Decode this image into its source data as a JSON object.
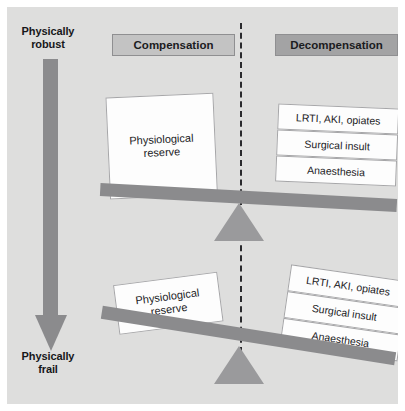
{
  "diagram": {
    "axis": {
      "top_label": "Physically\nrobust",
      "top_label_line1": "Physically",
      "top_label_line2": "robust",
      "bottom_label_line1": "Physically",
      "bottom_label_line2": "frail",
      "arrow_color": "#8b8b8d",
      "direction": "down"
    },
    "headers": [
      {
        "id": "compensation",
        "label": "Compensation",
        "fill": "#c3c3c3"
      },
      {
        "id": "decompensation",
        "label": "Decompensation",
        "fill": "#a3a3a4"
      }
    ],
    "divider": {
      "style": "dashed",
      "color": "#2a2a2d"
    },
    "scales": [
      {
        "id": "robust-scale",
        "state": "compensated",
        "tilt_degrees": 3.1,
        "reserve": {
          "label_line1": "Physiological",
          "label_line2": "reserve",
          "size": "large"
        },
        "stressors": [
          "LRTI, AKI, opiates",
          "Surgical insult",
          "Anaesthesia"
        ]
      },
      {
        "id": "frail-scale",
        "state": "decompensated",
        "tilt_degrees": 9,
        "reserve": {
          "label_line1": "Physiological",
          "label_line2": "reserve",
          "size": "small"
        },
        "stressors": [
          "LRTI, AKI, opiates",
          "Surgical insult",
          "Anaesthesia"
        ]
      }
    ]
  }
}
